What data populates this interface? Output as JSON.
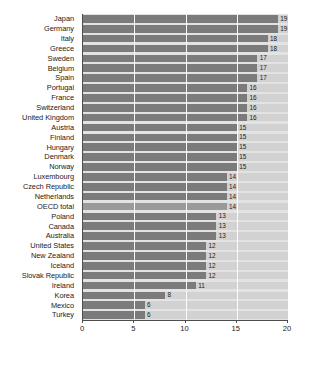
{
  "chart_data": {
    "type": "bar",
    "orientation": "horizontal",
    "title": "",
    "subtitle": "",
    "xlabel": "",
    "ylabel": "",
    "xlim": [
      0,
      20
    ],
    "xticks": [
      0,
      5,
      10,
      15,
      20
    ],
    "xtick_labels": [
      "0",
      "5",
      "10",
      "15",
      "20"
    ],
    "grid": true,
    "grid_axis": "x",
    "legend": null,
    "colors": {
      "bar": "#7b7b7b",
      "bar_highlight": "#9a9a9a",
      "track": "#d2d2d2",
      "plot_background": "#e3e3e3",
      "axis": "#4d4d4d",
      "text": "#1a1a1a",
      "gridline": "#ffffff"
    },
    "categories": [
      "Japan",
      "Germany",
      "Italy",
      "Greece",
      "Sweden",
      "Belgium",
      "Spain",
      "Portugal",
      "France",
      "Switzerland",
      "United Kingdom",
      "Austria",
      "Finland",
      "Hungary",
      "Denmark",
      "Norway",
      "Luxembourg",
      "Czech Republic",
      "Netherlands",
      "OECD total",
      "Poland",
      "Canada",
      "Australia",
      "United States",
      "New Zealand",
      "Iceland",
      "Slovak Republic",
      "Ireland",
      "Korea",
      "Mexico",
      "Turkey"
    ],
    "values": [
      19,
      19,
      18,
      18,
      17,
      17,
      17,
      16,
      16,
      16,
      16,
      15,
      15,
      15,
      15,
      15,
      14,
      14,
      14,
      14,
      13,
      13,
      13,
      12,
      12,
      12,
      12,
      11,
      8,
      6,
      6
    ],
    "value_labels": [
      "19",
      "19",
      "18",
      "18",
      "17",
      "17",
      "17",
      "16",
      "16",
      "16",
      "16",
      "15",
      "15",
      "15",
      "15",
      "15",
      "14",
      "14",
      "14",
      "14",
      "13",
      "13",
      "13",
      "12",
      "12",
      "12",
      "12",
      "11",
      "8",
      "6",
      "6"
    ],
    "highlight_categories": [
      "OECD total"
    ]
  }
}
